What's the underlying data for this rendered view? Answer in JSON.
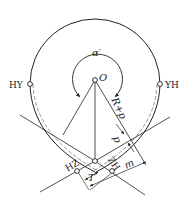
{
  "diagram": {
    "type": "circular-curve-with-transition-geometry",
    "labels": {
      "center": "O",
      "angle": "α′",
      "hy": "HY",
      "yh": "YH",
      "hz": "HZ",
      "zh": "ZH",
      "radius_shift": "R+p",
      "shift": "p",
      "tangent_length": "T",
      "offset": "m"
    },
    "colors": {
      "stroke": "#222222",
      "background": "#ffffff"
    }
  }
}
